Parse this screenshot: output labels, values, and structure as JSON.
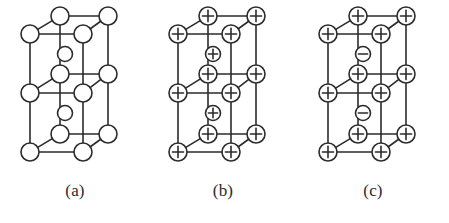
{
  "figure": {
    "background_color": "#ffffff",
    "stroke_color": "#2b2b2b",
    "node_fill": "#ffffff",
    "width": 449,
    "height": 223
  },
  "panels": [
    {
      "id": "panel-a",
      "label": "(a)",
      "x_offset": 0,
      "lattice_type": "double-cube",
      "corner_symbol": "",
      "interstitial_symbol": "",
      "corner_count": 12,
      "interstitial_count": 2,
      "description": "neutral atoms shown as open circles"
    },
    {
      "id": "panel-b",
      "label": "(b)",
      "x_offset": 148,
      "lattice_type": "double-cube",
      "corner_symbol": "+",
      "interstitial_symbol": "+",
      "corner_count": 12,
      "interstitial_count": 2,
      "description": "all sites positive"
    },
    {
      "id": "panel-c",
      "label": "(c)",
      "x_offset": 298,
      "lattice_type": "double-cube",
      "corner_symbol": "+",
      "interstitial_symbol": "−",
      "corner_count": 12,
      "interstitial_count": 2,
      "description": "positive corners with negative interstitials"
    }
  ],
  "geometry": {
    "corner_radius": 9,
    "interstitial_radius": 7.5,
    "line_width": 1.6,
    "nodes": {
      "back_left_x": 60,
      "back_right_x": 108,
      "front_left_x": 30,
      "front_right_x": 83,
      "row_back_y": [
        16,
        74,
        134
      ],
      "row_front_y": [
        34,
        93,
        152
      ],
      "interstitial": [
        {
          "x": 65,
          "y": 54
        },
        {
          "x": 65,
          "y": 113
        }
      ]
    }
  }
}
